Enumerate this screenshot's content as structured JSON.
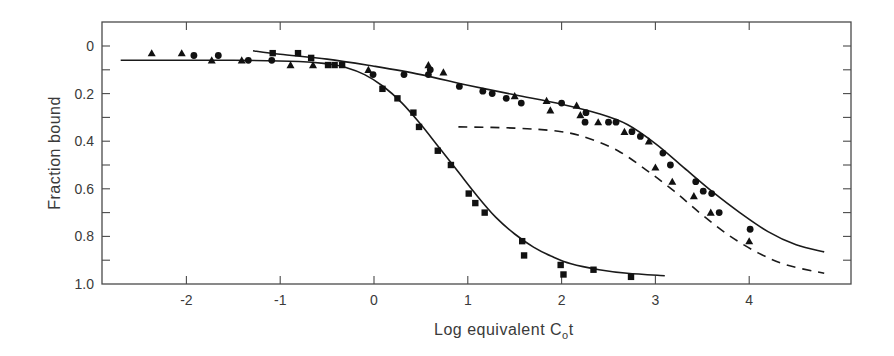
{
  "chart_data": {
    "type": "scatter",
    "title": "",
    "xlabel": "Log equivalent C₀t",
    "xlabel_main": "Log equivalent C",
    "xlabel_sub": "o",
    "xlabel_tail": "t",
    "ylabel": "Fraction bound",
    "xlim": [
      -2.9,
      5.1
    ],
    "ylim": [
      1.0,
      -0.05
    ],
    "y_inverted": true,
    "grid": false,
    "legend": null,
    "x_ticks": [
      -2,
      -1,
      0,
      1,
      2,
      3,
      4
    ],
    "x_tick_labels": [
      "-2",
      "-1",
      "0",
      "1",
      "2",
      "3",
      "4"
    ],
    "y_ticks": [
      0,
      0.2,
      0.4,
      0.6,
      0.8,
      1.0
    ],
    "y_tick_labels": [
      "0",
      "0.2",
      "0.4",
      "0.6",
      "0.8",
      "1.0"
    ],
    "y_minor_ticks": [
      0.1,
      0.3,
      0.5,
      0.7,
      0.9
    ],
    "series": [
      {
        "name": "squares",
        "marker": "square",
        "points": [
          [
            -1.08,
            0.03
          ],
          [
            -0.81,
            0.03
          ],
          [
            -0.67,
            0.05
          ],
          [
            -0.49,
            0.08
          ],
          [
            -0.42,
            0.08
          ],
          [
            -0.34,
            0.08
          ],
          [
            0.09,
            0.18
          ],
          [
            0.25,
            0.22
          ],
          [
            0.42,
            0.28
          ],
          [
            0.48,
            0.34
          ],
          [
            0.68,
            0.44
          ],
          [
            0.82,
            0.5
          ],
          [
            1.01,
            0.62
          ],
          [
            1.08,
            0.66
          ],
          [
            1.18,
            0.7
          ],
          [
            1.58,
            0.82
          ],
          [
            1.6,
            0.88
          ],
          [
            1.99,
            0.92
          ],
          [
            2.02,
            0.96
          ],
          [
            2.34,
            0.94
          ],
          [
            2.74,
            0.97
          ]
        ]
      },
      {
        "name": "circles",
        "marker": "circle",
        "points": [
          [
            -1.92,
            0.04
          ],
          [
            -1.66,
            0.04
          ],
          [
            -1.34,
            0.06
          ],
          [
            -1.09,
            0.06
          ],
          [
            -0.01,
            0.12
          ],
          [
            0.32,
            0.12
          ],
          [
            0.58,
            0.12
          ],
          [
            0.6,
            0.1
          ],
          [
            0.91,
            0.17
          ],
          [
            1.16,
            0.19
          ],
          [
            1.26,
            0.2
          ],
          [
            1.41,
            0.22
          ],
          [
            1.57,
            0.24
          ],
          [
            2.0,
            0.24
          ],
          [
            2.26,
            0.28
          ],
          [
            2.25,
            0.32
          ],
          [
            2.5,
            0.32
          ],
          [
            2.58,
            0.32
          ],
          [
            2.75,
            0.36
          ],
          [
            2.84,
            0.38
          ],
          [
            3.08,
            0.45
          ],
          [
            3.16,
            0.5
          ],
          [
            3.43,
            0.57
          ],
          [
            3.51,
            0.61
          ],
          [
            3.6,
            0.62
          ],
          [
            3.68,
            0.7
          ],
          [
            4.01,
            0.77
          ]
        ]
      },
      {
        "name": "triangles",
        "marker": "triangle",
        "points": [
          [
            -2.37,
            0.03
          ],
          [
            -2.05,
            0.03
          ],
          [
            -1.73,
            0.06
          ],
          [
            -1.41,
            0.06
          ],
          [
            -0.89,
            0.08
          ],
          [
            -0.65,
            0.08
          ],
          [
            -0.06,
            0.1
          ],
          [
            0.58,
            0.08
          ],
          [
            0.74,
            0.11
          ],
          [
            1.5,
            0.21
          ],
          [
            1.84,
            0.23
          ],
          [
            1.88,
            0.27
          ],
          [
            2.16,
            0.25
          ],
          [
            2.2,
            0.29
          ],
          [
            2.39,
            0.32
          ],
          [
            2.67,
            0.36
          ],
          [
            2.93,
            0.4
          ],
          [
            3.0,
            0.51
          ],
          [
            3.18,
            0.57
          ],
          [
            3.41,
            0.63
          ],
          [
            3.59,
            0.7
          ],
          [
            4.0,
            0.82
          ]
        ]
      }
    ],
    "curves": [
      {
        "name": "fit-squares",
        "style": "solid",
        "points": [
          [
            -2.7,
            0.06
          ],
          [
            -1.5,
            0.06
          ],
          [
            -0.8,
            0.065
          ],
          [
            -0.5,
            0.075
          ],
          [
            -0.3,
            0.09
          ],
          [
            -0.1,
            0.12
          ],
          [
            0.1,
            0.17
          ],
          [
            0.3,
            0.24
          ],
          [
            0.5,
            0.33
          ],
          [
            0.7,
            0.43
          ],
          [
            0.9,
            0.53
          ],
          [
            1.1,
            0.63
          ],
          [
            1.3,
            0.72
          ],
          [
            1.5,
            0.79
          ],
          [
            1.7,
            0.845
          ],
          [
            1.9,
            0.885
          ],
          [
            2.1,
            0.915
          ],
          [
            2.4,
            0.94
          ],
          [
            2.7,
            0.955
          ],
          [
            3.1,
            0.965
          ]
        ]
      },
      {
        "name": "fit-circles-triangles",
        "style": "solid",
        "points": [
          [
            -1.29,
            0.02
          ],
          [
            -1.0,
            0.035
          ],
          [
            -0.5,
            0.055
          ],
          [
            0.0,
            0.085
          ],
          [
            0.5,
            0.12
          ],
          [
            1.0,
            0.165
          ],
          [
            1.5,
            0.205
          ],
          [
            2.0,
            0.245
          ],
          [
            2.4,
            0.285
          ],
          [
            2.7,
            0.33
          ],
          [
            3.0,
            0.41
          ],
          [
            3.3,
            0.51
          ],
          [
            3.6,
            0.61
          ],
          [
            3.9,
            0.7
          ],
          [
            4.2,
            0.78
          ],
          [
            4.5,
            0.835
          ],
          [
            4.8,
            0.865
          ]
        ]
      },
      {
        "name": "predicted-dashed",
        "style": "dashed",
        "points": [
          [
            0.9,
            0.34
          ],
          [
            1.5,
            0.345
          ],
          [
            2.0,
            0.36
          ],
          [
            2.3,
            0.39
          ],
          [
            2.6,
            0.44
          ],
          [
            2.9,
            0.52
          ],
          [
            3.2,
            0.61
          ],
          [
            3.5,
            0.71
          ],
          [
            3.8,
            0.8
          ],
          [
            4.1,
            0.87
          ],
          [
            4.4,
            0.92
          ],
          [
            4.8,
            0.955
          ]
        ]
      }
    ]
  }
}
